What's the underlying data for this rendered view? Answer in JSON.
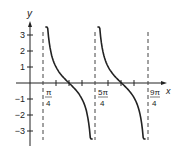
{
  "chart_data": {
    "type": "line",
    "title": "",
    "function": "y = cot(x - pi/4)",
    "xlabel": "x",
    "ylabel": "y",
    "y_ticks": [
      "3",
      "2",
      "1",
      "-1",
      "-2",
      "-3"
    ],
    "x_tick_labels": [
      {
        "num": "π",
        "den": "4"
      },
      {
        "num": "5π",
        "den": "4"
      },
      {
        "num": "9π",
        "den": "4"
      }
    ],
    "asymptotes": [
      "π/4",
      "5π/4",
      "9π/4"
    ],
    "ylim": [
      -3.5,
      3.5
    ],
    "grid": false
  },
  "labels": {
    "y_axis": "y",
    "x_axis": "x",
    "pi_num": "π",
    "pi_den": "4",
    "five_pi_num": "5π",
    "five_pi_den": "4",
    "nine_pi_num": "9π",
    "nine_pi_den": "4",
    "t3": "3",
    "t2": "2",
    "t1": "1",
    "tm1": "−1",
    "tm2": "−2",
    "tm3": "−3"
  }
}
